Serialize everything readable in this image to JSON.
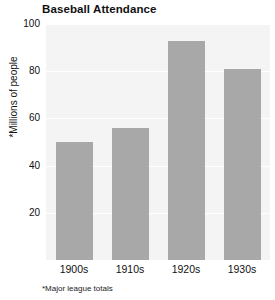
{
  "chart_data": {
    "type": "bar",
    "title": "Baseball Attendance",
    "xlabel": "",
    "ylabel": "*Millions of people",
    "categories": [
      "1900s",
      "1910s",
      "1920s",
      "1930s"
    ],
    "values": [
      50,
      56,
      93,
      81
    ],
    "ylim": [
      0,
      100
    ],
    "yticks": [
      20,
      40,
      60,
      80,
      100
    ],
    "ytick_labels": [
      "20",
      "40",
      "60",
      "80",
      "100"
    ],
    "grid": true,
    "legend": false,
    "annotations": [
      "*Major league totals"
    ],
    "series": [
      {
        "name": "Attendance",
        "values": [
          50,
          56,
          93,
          81
        ],
        "color": "#a8a8a8"
      }
    ]
  },
  "colors": {
    "bar": "#a8a8a8",
    "plot_background": "#f4f4f4",
    "gridline": "#ffffff",
    "page_background": "#ffffff",
    "text": "#111111"
  },
  "footnote": "*Major league totals"
}
